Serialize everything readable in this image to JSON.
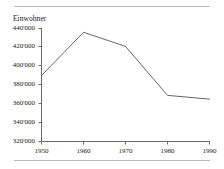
{
  "figure": {
    "axis_title": "Einwohner",
    "rule_color": "#b9b9b9",
    "axis_color": "#6b6b6b",
    "line_color": "#555555"
  },
  "chart_data": {
    "type": "line",
    "title": "",
    "subtitle": "",
    "xlabel": "",
    "ylabel": "Einwohner",
    "x": [
      1950,
      1960,
      1970,
      1980,
      1990
    ],
    "values": [
      390000,
      436000,
      421000,
      369000,
      365000
    ],
    "series": [
      {
        "name": "Einwohner",
        "values": [
          390000,
          436000,
          421000,
          369000,
          365000
        ]
      }
    ],
    "xlim": [
      1950,
      1990
    ],
    "ylim": [
      320000,
      440000
    ],
    "xticks": [
      1950,
      1960,
      1970,
      1980,
      1990
    ],
    "xtick_labels": [
      "1950",
      "1960",
      "1970",
      "1980",
      "1990"
    ],
    "yticks": [
      320000,
      340000,
      360000,
      380000,
      400000,
      420000,
      440000
    ],
    "ytick_labels": [
      "320'000",
      "340'000",
      "360'000",
      "380'000",
      "400'000",
      "420'000",
      "440'000"
    ],
    "grid": false,
    "legend": false,
    "legend_position": "none",
    "annotations": []
  }
}
